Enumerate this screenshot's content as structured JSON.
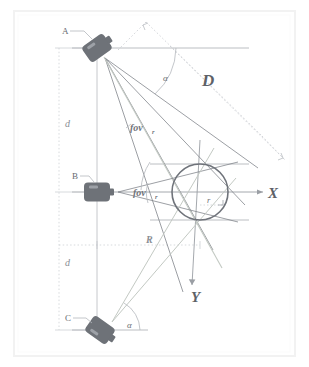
{
  "figure": {
    "background_color": "#ffffff",
    "frame_color": "#f0f0f0",
    "line_color": "#8e9298",
    "dotted_color": "#c6c9cd",
    "camera_body_color": "#6e7278",
    "circle_color": "#73777d"
  },
  "cameras": [
    {
      "id": "cam-a",
      "label": "A",
      "x": 97,
      "y": 48,
      "rotation": -35,
      "label_x": 62,
      "label_y": 30
    },
    {
      "id": "cam-b",
      "label": "B",
      "x": 97,
      "y": 192,
      "rotation": 0,
      "label_x": 73,
      "label_y": 175
    },
    {
      "id": "cam-c",
      "label": "C",
      "x": 100,
      "y": 330,
      "rotation": 35,
      "label_x": 65,
      "label_y": 318
    }
  ],
  "target": {
    "label": "r",
    "label_x": 203,
    "label_y": 202,
    "center_x": 200,
    "center_y": 192,
    "radius": 28
  },
  "axes": {
    "x_label": "X",
    "x_label_x": 272,
    "x_label_y": 195,
    "y_label": "Y",
    "y_label_x": 197,
    "y_label_y": 297
  },
  "angles": [
    {
      "name": "alpha-top",
      "label": "α",
      "x": 163,
      "y": 77
    },
    {
      "name": "alpha-bottom",
      "label": "α",
      "x": 127,
      "y": 325
    }
  ],
  "fov_labels": [
    {
      "name": "fov-camera-a",
      "text": "fov",
      "subscript": "r",
      "x": 130,
      "y": 127
    },
    {
      "name": "fov-camera-b",
      "text": "fov",
      "subscript": "r",
      "x": 133,
      "y": 193
    }
  ],
  "dimensions": [
    {
      "name": "distance-d-upper",
      "label": "d",
      "x": 68,
      "y": 123
    },
    {
      "name": "distance-d-lower",
      "label": "d",
      "x": 68,
      "y": 262
    },
    {
      "name": "distance-R",
      "label": "R",
      "x": 150,
      "y": 246
    },
    {
      "name": "distance-D",
      "label": "D",
      "x": 209,
      "y": 80
    }
  ]
}
